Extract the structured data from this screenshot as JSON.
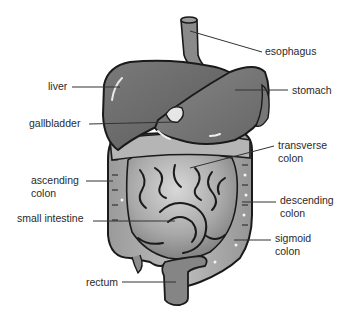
{
  "diagram": {
    "colors": {
      "background": "#ffffff",
      "organ_dark": "#6a6a6a",
      "organ_mid": "#8c8c8c",
      "intestine_light": "#b8b8b8",
      "outline": "#1a1a1a",
      "leader_line": "#333333",
      "text": "#2a2a2a"
    },
    "labels": [
      {
        "id": "esophagus",
        "text": "esophagus",
        "lines": [
          "esophagus"
        ],
        "x": 265,
        "y": 45,
        "anchor": [
          190,
          31
        ],
        "line_from": [
          262,
          52
        ]
      },
      {
        "id": "liver",
        "text": "liver",
        "lines": [
          "liver"
        ],
        "x": 48,
        "y": 80,
        "anchor": [
          120,
          87
        ],
        "line_from": [
          72,
          87
        ]
      },
      {
        "id": "stomach",
        "text": "stomach",
        "lines": [
          "stomach"
        ],
        "x": 292,
        "y": 84,
        "anchor": [
          235,
          90
        ],
        "line_from": [
          288,
          90
        ]
      },
      {
        "id": "gallbladder",
        "text": "gallbladder",
        "lines": [
          "gallbladder"
        ],
        "x": 29,
        "y": 117,
        "anchor": [
          175,
          122
        ],
        "line_from": [
          89,
          124
        ]
      },
      {
        "id": "transverse-colon",
        "text": "transverse colon",
        "lines": [
          "transverse",
          "colon"
        ],
        "x": 278,
        "y": 139,
        "anchor": [
          190,
          168
        ],
        "line_from": [
          274,
          146
        ]
      },
      {
        "id": "ascending-colon",
        "text": "ascending colon",
        "lines": [
          "ascending",
          "colon"
        ],
        "x": 31,
        "y": 174,
        "anchor": [
          113,
          181
        ],
        "line_from": [
          86,
          181
        ]
      },
      {
        "id": "descending-colon",
        "text": "descending colon",
        "lines": [
          "descending",
          "colon"
        ],
        "x": 280,
        "y": 194,
        "anchor": [
          242,
          202
        ],
        "line_from": [
          276,
          202
        ]
      },
      {
        "id": "small-intestine",
        "text": "small intestine",
        "lines": [
          "small intestine"
        ],
        "x": 17,
        "y": 212,
        "anchor": [
          175,
          221
        ],
        "line_from": [
          93,
          221
        ]
      },
      {
        "id": "sigmoid-colon",
        "text": "sigmoid colon",
        "lines": [
          "sigmoid",
          "colon"
        ],
        "x": 275,
        "y": 232,
        "anchor": [
          234,
          240
        ],
        "line_from": [
          271,
          240
        ]
      },
      {
        "id": "rectum",
        "text": "rectum",
        "lines": [
          "rectum"
        ],
        "x": 86,
        "y": 276,
        "anchor": [
          176,
          282
        ],
        "line_from": [
          122,
          282
        ]
      }
    ]
  }
}
